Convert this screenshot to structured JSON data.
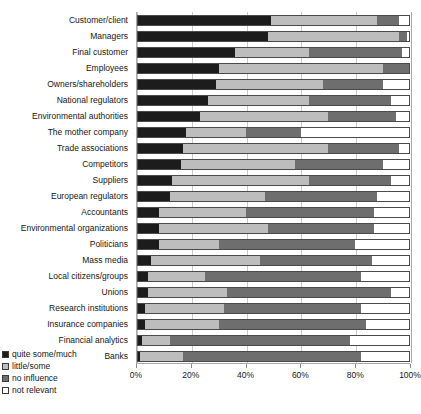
{
  "chart_data": {
    "type": "bar",
    "subtype": "stacked-horizontal-100pct",
    "title": "",
    "xlabel": "",
    "ylabel": "",
    "xlim": [
      0,
      100
    ],
    "xticks": [
      "0%",
      "20%",
      "40%",
      "60%",
      "80%",
      "100%"
    ],
    "xtick_values": [
      0,
      20,
      40,
      60,
      80,
      100
    ],
    "grid": "vertical",
    "legend_position": "bottom-left",
    "legend": [
      {
        "label": "quite some/much",
        "color": "#1c1c1c",
        "key": "quite_some_much"
      },
      {
        "label": "little/some",
        "color": "#bdbdbd",
        "key": "little_some"
      },
      {
        "label": "no influence",
        "color": "#6e6e6e",
        "key": "no_influence"
      },
      {
        "label": "not relevant",
        "color": "#ffffff",
        "key": "not_relevant"
      }
    ],
    "categories": [
      "Customer/client",
      "Managers",
      "Final customer",
      "Employees",
      "Owners/shareholders",
      "National regulators",
      "Environmental authorities",
      "The mother company",
      "Trade associations",
      "Competitors",
      "Suppliers",
      "European regulators",
      "Accountants",
      "Environmental organizations",
      "Politicians",
      "Mass media",
      "Local citizens/groups",
      "Unions",
      "Research institutions",
      "Insurance companies",
      "Financial analytics",
      "Banks"
    ],
    "series": [
      {
        "name": "quite some/much",
        "color": "#1c1c1c",
        "values": [
          49,
          48,
          36,
          30,
          29,
          26,
          23,
          18,
          17,
          16,
          13,
          12,
          8,
          8,
          8,
          5,
          4,
          4,
          3,
          3,
          2,
          1
        ]
      },
      {
        "name": "little/some",
        "color": "#bdbdbd",
        "values": [
          39,
          48,
          27,
          60,
          39,
          37,
          47,
          22,
          53,
          42,
          50,
          35,
          32,
          40,
          22,
          40,
          21,
          29,
          29,
          27,
          10,
          16
        ]
      },
      {
        "name": "no influence",
        "color": "#6e6e6e",
        "values": [
          8,
          3,
          34,
          10,
          22,
          30,
          25,
          20,
          26,
          32,
          30,
          41,
          47,
          39,
          50,
          41,
          57,
          60,
          50,
          54,
          66,
          65
        ]
      },
      {
        "name": "not relevant",
        "color": "#ffffff",
        "values": [
          4,
          1,
          3,
          0,
          10,
          7,
          5,
          40,
          4,
          10,
          7,
          12,
          13,
          13,
          20,
          14,
          18,
          7,
          18,
          16,
          22,
          18
        ]
      }
    ]
  }
}
